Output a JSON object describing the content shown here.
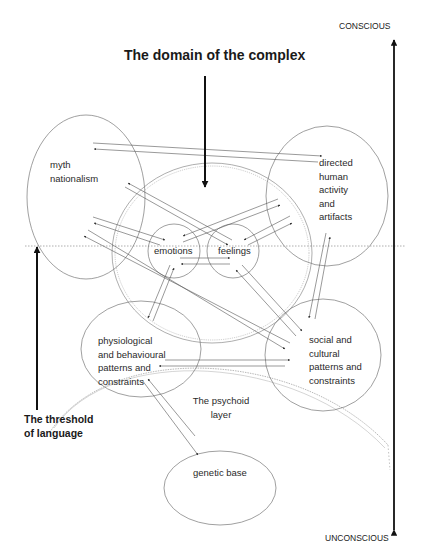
{
  "title": "The domain of the complex",
  "axis": {
    "top_label": "CONSCIOUS",
    "bottom_label": "UNCONSCIOUS"
  },
  "threshold": {
    "line1": "The threshold",
    "line2": "of language"
  },
  "psychoid": {
    "line1": "The psychoid",
    "line2": "layer"
  },
  "nodes": {
    "myth": {
      "line1": "myth",
      "line2": "nationalism"
    },
    "directed": {
      "line1": "directed",
      "line2": "human",
      "line3": "activity",
      "line4": "and",
      "line5": "artifacts"
    },
    "emotions": {
      "label": "emotions"
    },
    "feelings": {
      "label": "feelings"
    },
    "physiological": {
      "line1": "physiological",
      "line2": "and behavioural",
      "line3": "patterns and",
      "line4": "constraints"
    },
    "social": {
      "line1": "social and",
      "line2": "cultural",
      "line3": "patterns and",
      "line4": "constraints"
    },
    "genetic": {
      "label": "genetic base"
    }
  },
  "colors": {
    "line": "#555555",
    "dotted": "#888888",
    "arrow": "#111111"
  }
}
